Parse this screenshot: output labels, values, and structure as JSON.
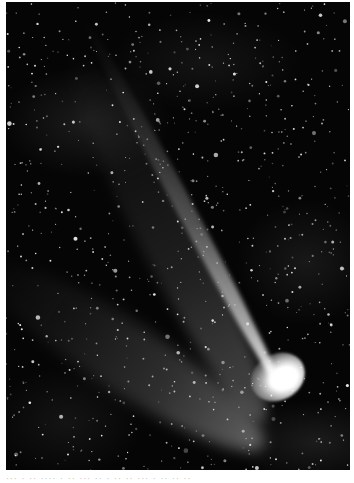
{
  "image": {
    "subject": "Comet with long ion tail and diffuse dust tail against dense starfield",
    "alt": "Black-and-white astrophotograph of a bright comet in the lower right, with a narrow bright tail extending to the upper left and a broader fainter tail fanning to the left",
    "colors": {
      "background": "#ffffff",
      "sky": "#050505",
      "coma": "#ffffff",
      "tail": "#d0d0d0",
      "stars": "#e6e6e6"
    }
  },
  "caption": {
    "text": "··· · ·· ···· · ·· ··· ·· · ·· ·· ··· · ·· ·· ··"
  }
}
